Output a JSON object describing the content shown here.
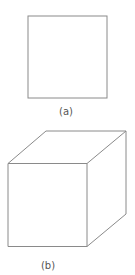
{
  "figure": {
    "stroke_color": "#8a8a8a",
    "panels": [
      {
        "id": "a",
        "caption": "(a)",
        "shape": "square",
        "description": "front view of a square face"
      },
      {
        "id": "b",
        "caption": "(b)",
        "shape": "cube",
        "description": "oblique projection of a cube"
      }
    ]
  }
}
